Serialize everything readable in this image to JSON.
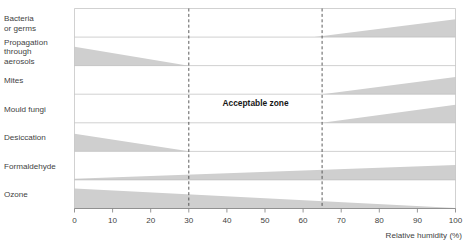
{
  "chart_data": {
    "type": "area",
    "title": "",
    "subtitle": "",
    "xlabel": "Relative humidity (%)",
    "ylabel": "",
    "xlim": [
      0,
      100
    ],
    "xticks": [
      0,
      10,
      20,
      30,
      40,
      50,
      60,
      70,
      80,
      90,
      100
    ],
    "xtick_labels": [
      "0",
      "10",
      "20",
      "30",
      "40",
      "50",
      "60",
      "70",
      "80",
      "90",
      "100"
    ],
    "grid": true,
    "legend": "none",
    "annotations": [
      {
        "name": "acceptable-zone",
        "text": "Acceptable zone",
        "x_start": 30,
        "x_end": 65,
        "x_center": 47.5
      }
    ],
    "reference_lines": [
      {
        "name": "lower-comfort-limit",
        "x": 30,
        "style": "dashed"
      },
      {
        "name": "upper-comfort-limit",
        "x": 65,
        "style": "dashed"
      }
    ],
    "categories": [
      "Bacteria\nor germs",
      "Propagation\nthrough\naerosols",
      "Mites",
      "Mould fungi",
      "Desiccation",
      "Formaldehyde",
      "Ozone"
    ],
    "series": [
      {
        "name": "Bacteria or germs",
        "align": "bottom",
        "points": [
          {
            "x": 63,
            "thickness": 0
          },
          {
            "x": 100,
            "thickness": 0.62
          }
        ]
      },
      {
        "name": "Propagation through aerosols",
        "align": "bottom",
        "points": [
          {
            "x": 0,
            "thickness": 0.66
          },
          {
            "x": 30,
            "thickness": 0
          }
        ]
      },
      {
        "name": "Mites",
        "align": "bottom",
        "points": [
          {
            "x": 65,
            "thickness": 0
          },
          {
            "x": 100,
            "thickness": 0.6
          }
        ]
      },
      {
        "name": "Mould fungi",
        "align": "bottom",
        "points": [
          {
            "x": 65,
            "thickness": 0
          },
          {
            "x": 100,
            "thickness": 0.63
          }
        ]
      },
      {
        "name": "Desiccation",
        "align": "bottom",
        "points": [
          {
            "x": 0,
            "thickness": 0.62
          },
          {
            "x": 30,
            "thickness": 0
          }
        ]
      },
      {
        "name": "Formaldehyde",
        "align": "bottom",
        "points": [
          {
            "x": 0,
            "thickness": 0.04
          },
          {
            "x": 100,
            "thickness": 0.52
          }
        ]
      },
      {
        "name": "Ozone",
        "align": "bottom",
        "points": [
          {
            "x": 0,
            "thickness": 0.7
          },
          {
            "x": 100,
            "thickness": 0.02
          }
        ]
      }
    ],
    "colors": {
      "band_fill": "#cfcfcf",
      "grid": "#bdbdbd",
      "axis": "#8a8a8a",
      "dashed": "#4a4a4a",
      "text": "#3f3f3f",
      "background": "#ffffff"
    }
  }
}
